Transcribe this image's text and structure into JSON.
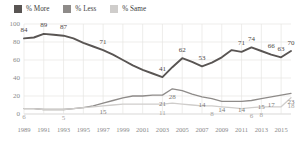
{
  "legend": {
    "position": "top-left",
    "items": [
      {
        "label": "% More",
        "color": "#595553",
        "name": "legend-item-more"
      },
      {
        "label": "% Less",
        "color": "#8e8b89",
        "name": "legend-item-less"
      },
      {
        "label": "% Same",
        "color": "#cfcdcb",
        "name": "legend-item-same"
      }
    ]
  },
  "axes": {
    "y_ticks": [
      "0",
      "20",
      "40",
      "60",
      "80",
      "100"
    ],
    "x_ticks": [
      "1989",
      "1991",
      "1993",
      "1995",
      "1997",
      "1999",
      "2001",
      "2003",
      "2005",
      "2007",
      "2009",
      "2011",
      "2013",
      "2015"
    ]
  },
  "chart_data": {
    "type": "line",
    "title": "",
    "subtitle": "",
    "xlabel": "",
    "ylabel": "",
    "xlim": [
      1989,
      2016
    ],
    "ylim": [
      0,
      100
    ],
    "grid": true,
    "legend_position": "top-left",
    "x": [
      1989,
      1990,
      1991,
      1992,
      1993,
      1994,
      1995,
      1996,
      1997,
      1998,
      1999,
      2000,
      2001,
      2002,
      2003,
      2004,
      2005,
      2006,
      2007,
      2008,
      2009,
      2010,
      2011,
      2012,
      2013,
      2014,
      2015,
      2016
    ],
    "series": [
      {
        "name": "% More",
        "color": "#595553",
        "values": [
          84,
          85,
          89,
          88,
          87,
          84,
          79,
          75,
          71,
          66,
          60,
          54,
          49,
          45,
          41,
          52,
          62,
          58,
          53,
          57,
          63,
          71,
          69,
          74,
          70,
          66,
          63,
          70
        ],
        "labels": [
          {
            "x": 1989,
            "value": 84
          },
          {
            "x": 1991,
            "value": 89
          },
          {
            "x": 1993,
            "value": 87
          },
          {
            "x": 1997,
            "value": 71
          },
          {
            "x": 2003,
            "value": 41
          },
          {
            "x": 2005,
            "value": 62
          },
          {
            "x": 2007,
            "value": 53
          },
          {
            "x": 2011,
            "value": 71
          },
          {
            "x": 2012,
            "value": 74
          },
          {
            "x": 2014,
            "value": 66
          },
          {
            "x": 2015,
            "value": 63
          },
          {
            "x": 2016,
            "value": 70
          }
        ]
      },
      {
        "name": "% Less",
        "color": "#8e8b89",
        "values": [
          6,
          6,
          5,
          5,
          5,
          6,
          7,
          9,
          12,
          15,
          18,
          20,
          20,
          21,
          21,
          28,
          26,
          22,
          19,
          17,
          14,
          14,
          14,
          15,
          17,
          19,
          21,
          23
        ],
        "labels": [
          {
            "x": 1997,
            "value": 15
          },
          {
            "x": 2003,
            "value": 21
          },
          {
            "x": 2004,
            "value": 28
          },
          {
            "x": 2007,
            "value": 14
          },
          {
            "x": 2009,
            "value": 14
          },
          {
            "x": 2011,
            "value": 14
          },
          {
            "x": 2013,
            "value": 15
          },
          {
            "x": 2014,
            "value": 17
          },
          {
            "x": 2016,
            "value": 23
          }
        ]
      },
      {
        "name": "% Same",
        "color": "#cfcdcb",
        "values": [
          6,
          6,
          5,
          5,
          5,
          6,
          7,
          8,
          9,
          10,
          11,
          11,
          11,
          11,
          11,
          12,
          11,
          10,
          9,
          9,
          8,
          7,
          6,
          7,
          8,
          8,
          8,
          18
        ],
        "labels": [
          {
            "x": 1989,
            "value": 6
          },
          {
            "x": 1993,
            "value": 5
          },
          {
            "x": 2003,
            "value": 11
          },
          {
            "x": 2008,
            "value": 8
          },
          {
            "x": 2012,
            "value": 6
          },
          {
            "x": 2013,
            "value": 8
          },
          {
            "x": 2016,
            "value": 18
          }
        ]
      }
    ]
  }
}
